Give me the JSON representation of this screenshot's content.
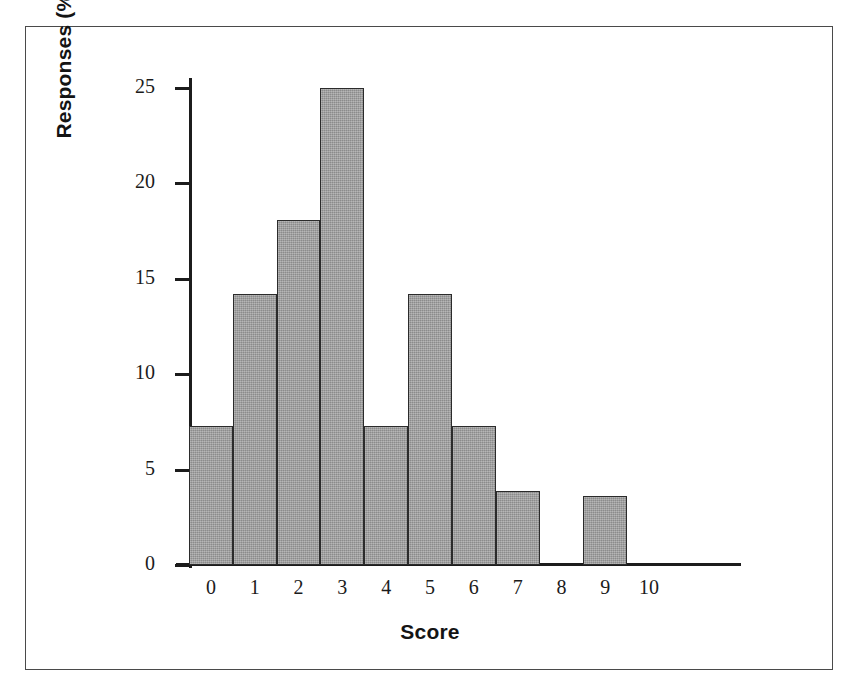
{
  "figure": {
    "background_color": "#ffffff",
    "frame_color": "#4a4a4a",
    "axis_color": "#1c1c1c",
    "bar_fill_color": "#9a9a9a",
    "bar_edge_color": "#2b2b2b"
  },
  "chart_data": {
    "type": "bar",
    "title": "",
    "subtitle": "",
    "xlabel": "Score",
    "ylabel": "Responses (%)",
    "categories": [
      "0",
      "1",
      "2",
      "3",
      "4",
      "5",
      "6",
      "7",
      "8",
      "9",
      "10"
    ],
    "values": [
      7.3,
      14.2,
      18.1,
      25.0,
      7.3,
      14.2,
      7.3,
      3.9,
      0.0,
      3.6,
      0.0
    ],
    "xlim": [
      -0.5,
      10.5
    ],
    "ylim": [
      0,
      26.5
    ],
    "ytick_labels": [
      "25",
      "20",
      "15",
      "10",
      "5",
      "0"
    ],
    "ytick_values": [
      25,
      20,
      15,
      10,
      5,
      0
    ],
    "xtick_labels": [
      "0",
      "1",
      "2",
      "3",
      "4",
      "5",
      "6",
      "7",
      "8",
      "9",
      "10"
    ],
    "grid": false,
    "legend": null,
    "legend_position": "none",
    "annotations": []
  }
}
